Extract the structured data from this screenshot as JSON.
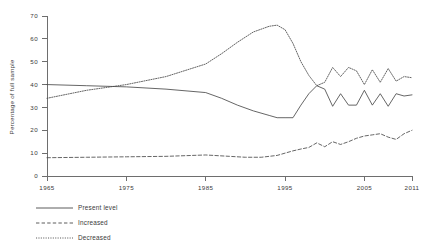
{
  "chart_data": {
    "type": "line",
    "title": "",
    "subtitle": "",
    "xlabel": "",
    "ylabel": "Percentage of full sample",
    "xlim": [
      1965,
      2011
    ],
    "ylim": [
      0,
      70
    ],
    "grid": false,
    "legend_position": "below-left",
    "x_ticks": [
      1965,
      1975,
      1985,
      1995,
      2005,
      2011
    ],
    "x_tick_labels": [
      "1965",
      "1975",
      "1985",
      "1995",
      "2005",
      "2011"
    ],
    "y_ticks": [
      0,
      10,
      20,
      30,
      40,
      50,
      60,
      70
    ],
    "y_tick_labels": [
      "0",
      "10",
      "20",
      "30",
      "40",
      "50",
      "60",
      "70"
    ],
    "series": [
      {
        "name": "Present level",
        "style": "solid",
        "color": "#4a4a4a",
        "x": [
          1965,
          1970,
          1975,
          1980,
          1985,
          1987,
          1989,
          1991,
          1993,
          1994,
          1995,
          1996,
          1997,
          1998,
          1999,
          2000,
          2001,
          2002,
          2003,
          2004,
          2005,
          2006,
          2007,
          2008,
          2009,
          2010,
          2011
        ],
        "values": [
          40,
          39.5,
          39,
          38,
          36.5,
          34,
          31,
          28.5,
          26.5,
          25.5,
          25.5,
          25.5,
          31,
          36,
          39.5,
          38,
          30.5,
          36,
          31,
          31,
          37.5,
          31,
          36,
          30.5,
          36,
          35,
          35.5
        ]
      },
      {
        "name": "Increased",
        "style": "dashed",
        "color": "#4a4a4a",
        "x": [
          1965,
          1970,
          1975,
          1980,
          1985,
          1988,
          1990,
          1992,
          1994,
          1995,
          1996,
          1997,
          1998,
          1999,
          2000,
          2001,
          2002,
          2003,
          2004,
          2005,
          2006,
          2007,
          2008,
          2009,
          2010,
          2011
        ],
        "values": [
          8,
          8.2,
          8.4,
          8.6,
          9.2,
          8.6,
          8.2,
          8.2,
          9,
          10,
          11,
          11.8,
          12.5,
          14.5,
          12.8,
          15,
          13.8,
          15,
          16.5,
          17.5,
          18,
          18.5,
          17,
          16,
          18.5,
          20
        ]
      },
      {
        "name": "Decreased",
        "style": "dotted",
        "color": "#4a4a4a",
        "x": [
          1965,
          1970,
          1975,
          1980,
          1985,
          1987,
          1989,
          1991,
          1993,
          1994,
          1995,
          1996,
          1997,
          1998,
          1999,
          2000,
          2001,
          2002,
          2003,
          2004,
          2005,
          2006,
          2007,
          2008,
          2009,
          2010,
          2011
        ],
        "values": [
          34,
          37.5,
          40,
          43.5,
          49,
          53.5,
          58.5,
          63,
          65.5,
          66,
          64,
          58,
          50,
          44,
          39.5,
          41,
          47.5,
          43.5,
          47.5,
          46,
          40,
          46.5,
          41,
          47,
          41.5,
          43.5,
          43
        ]
      }
    ],
    "legend": [
      {
        "label": "Present level",
        "style": "solid"
      },
      {
        "label": "Increased",
        "style": "dashed"
      },
      {
        "label": "Decreased",
        "style": "dotted"
      }
    ]
  }
}
